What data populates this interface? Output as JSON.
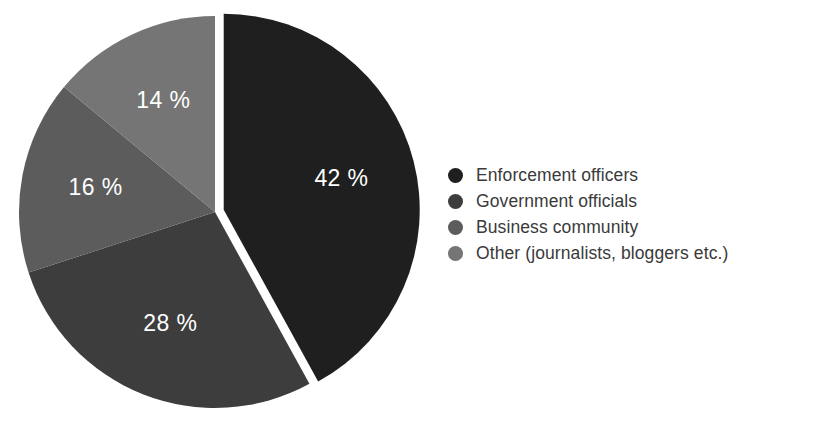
{
  "chart_data": {
    "type": "pie",
    "title": "",
    "subtitle": "",
    "xlabel": "",
    "ylabel": "",
    "grid": false,
    "legend_position": "right",
    "units": "%",
    "start_angle_deg": 0,
    "direction": "clockwise",
    "categories": [
      "Enforcement officers",
      "Government officials",
      "Business community",
      "Other (journalists, bloggers etc.)"
    ],
    "values": [
      42,
      28,
      16,
      14
    ],
    "data_labels": [
      "42 %",
      "28 %",
      "16 %",
      "14 %"
    ],
    "colors": [
      "#1f1f1f",
      "#3d3d3d",
      "#5c5c5c",
      "#757575"
    ],
    "exploded": [
      true,
      false,
      false,
      false
    ],
    "slices": [
      {
        "label": "Enforcement officers",
        "value": 42,
        "data_label": "42 %",
        "color": "#1f1f1f",
        "exploded": true
      },
      {
        "label": "Government officials",
        "value": 28,
        "data_label": "28 %",
        "color": "#3d3d3d",
        "exploded": false
      },
      {
        "label": "Business community",
        "value": 16,
        "data_label": "16 %",
        "color": "#5c5c5c",
        "exploded": false
      },
      {
        "label": "Other (journalists, bloggers etc.)",
        "value": 14,
        "data_label": "14 %",
        "color": "#757575",
        "exploded": false
      }
    ]
  },
  "legend": {
    "items": [
      {
        "label": "Enforcement officers",
        "color": "#1f1f1f"
      },
      {
        "label": "Government officials",
        "color": "#3d3d3d"
      },
      {
        "label": "Business community",
        "color": "#5c5c5c"
      },
      {
        "label": "Other (journalists, bloggers etc.)",
        "color": "#757575"
      }
    ]
  },
  "geometry": {
    "center_x": 215,
    "center_y": 212,
    "radius": 196,
    "explode_offset": 9,
    "label_radius_ratio": 0.62
  }
}
